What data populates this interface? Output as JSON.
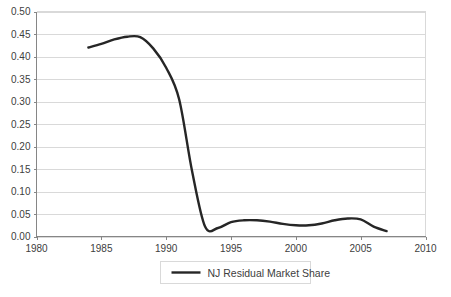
{
  "chart_data": {
    "type": "line",
    "title": "",
    "xlabel": "",
    "ylabel": "",
    "xlim": [
      1980,
      2010
    ],
    "ylim": [
      0.0,
      0.5
    ],
    "grid": true,
    "legend_position": "bottom",
    "x_ticks": [
      "1980",
      "1985",
      "1990",
      "1995",
      "2000",
      "2005",
      "2010"
    ],
    "x_tick_values": [
      1980,
      1985,
      1990,
      1995,
      2000,
      2005,
      2010
    ],
    "y_ticks": [
      "0.00",
      "0.05",
      "0.10",
      "0.15",
      "0.20",
      "0.25",
      "0.30",
      "0.35",
      "0.40",
      "0.45",
      "0.50"
    ],
    "y_tick_values": [
      0.0,
      0.05,
      0.1,
      0.15,
      0.2,
      0.25,
      0.3,
      0.35,
      0.4,
      0.45,
      0.5
    ],
    "series": [
      {
        "name": "NJ Residual Market Share",
        "color": "#262626",
        "x": [
          1984,
          1985,
          1986,
          1987,
          1988,
          1989,
          1990,
          1991,
          1992,
          1993,
          1994,
          1995,
          1996,
          1997,
          1998,
          1999,
          2000,
          2001,
          2002,
          2003,
          2004,
          2005,
          2006,
          2007
        ],
        "values": [
          0.42,
          0.428,
          0.438,
          0.444,
          0.443,
          0.418,
          0.375,
          0.305,
          0.145,
          0.022,
          0.019,
          0.032,
          0.036,
          0.036,
          0.033,
          0.028,
          0.025,
          0.025,
          0.029,
          0.036,
          0.04,
          0.038,
          0.022,
          0.012
        ]
      }
    ]
  },
  "legend": {
    "entries": [
      {
        "label": "NJ Residual Market Share"
      }
    ]
  }
}
